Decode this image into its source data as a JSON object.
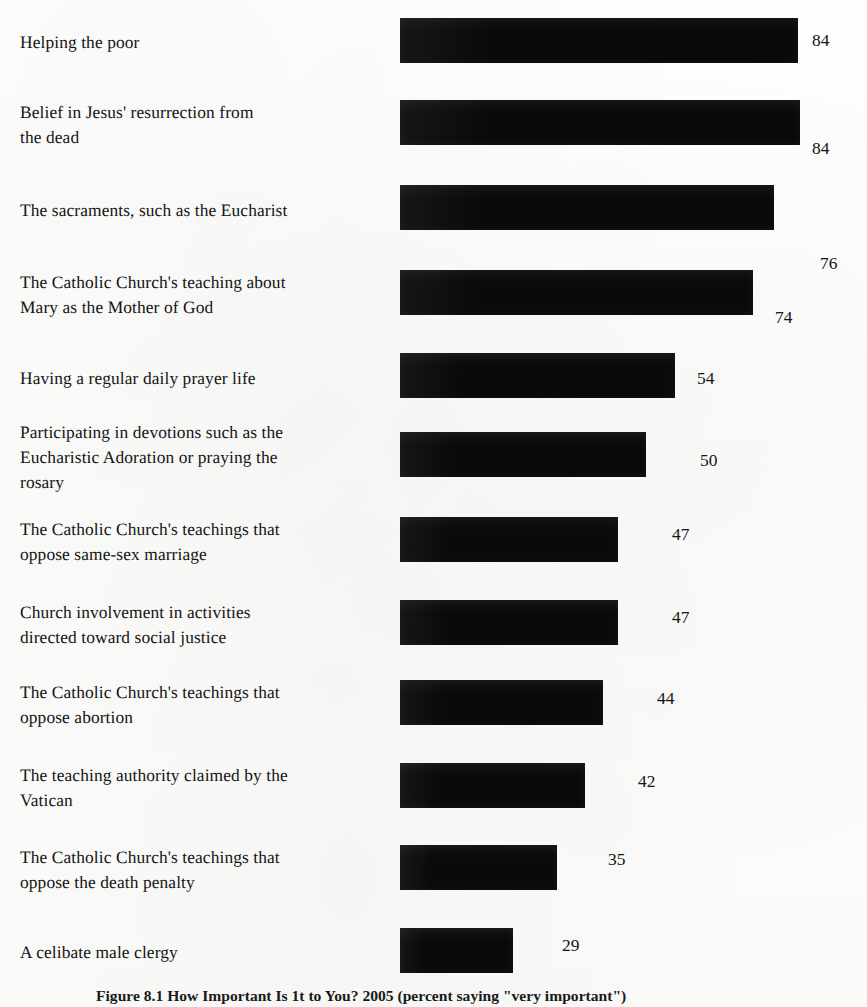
{
  "figure": {
    "caption": "Figure 8.1   How Important Is 1t to You? 2005 (percent saying \"very important\")"
  },
  "chart_data": {
    "type": "bar",
    "orientation": "horizontal",
    "title": "",
    "xlabel": "",
    "ylabel": "",
    "grid": false,
    "legend": null,
    "value_suffix": "",
    "xlim": [
      0,
      100
    ],
    "categories": [
      "Helping the poor",
      "Belief in Jesus' resurrection from\nthe dead",
      "The sacraments, such as the Eucharist",
      "The Catholic Church's teaching about\nMary as the Mother of God",
      "Having a regular daily prayer life",
      "Participating in devotions such as the\nEucharistic Adoration or praying the\nrosary",
      "The Catholic Church's teachings that\noppose same-sex marriage",
      "Church involvement in activities\ndirected toward social justice",
      "The Catholic Church's teachings that\noppose abortion",
      "The teaching authority claimed by the\nVatican",
      "The Catholic Church's teachings that\noppose the death penalty",
      "A celibate male clergy"
    ],
    "values": [
      84,
      84,
      76,
      74,
      54,
      50,
      47,
      47,
      44,
      42,
      35,
      29
    ],
    "bar_color": "#0a0a0a",
    "bars": [
      {
        "label": "Helping the poor",
        "value": 84,
        "bar_top": 18,
        "bar_width": 398,
        "label_top": 30,
        "value_left": 812,
        "value_top": 30
      },
      {
        "label": "Belief in Jesus' resurrection from\nthe dead",
        "value": 84,
        "bar_top": 100,
        "bar_width": 400,
        "label_top": 100,
        "value_left": 812,
        "value_top": 138
      },
      {
        "label": "The sacraments, such as the Eucharist",
        "value": 76,
        "bar_top": 185,
        "bar_width": 374,
        "label_top": 198,
        "value_left": 820,
        "value_top": 253
      },
      {
        "label": "The Catholic Church's teaching about\nMary as the Mother of God",
        "value": 74,
        "bar_top": 270,
        "bar_width": 353,
        "label_top": 270,
        "value_left": 775,
        "value_top": 307
      },
      {
        "label": "Having a regular daily prayer life",
        "value": 54,
        "bar_top": 353,
        "bar_width": 275,
        "label_top": 366,
        "value_left": 697,
        "value_top": 368
      },
      {
        "label": "Participating in devotions such as the\nEucharistic Adoration or praying the\nrosary",
        "value": 50,
        "bar_top": 432,
        "bar_width": 246,
        "label_top": 420,
        "value_left": 700,
        "value_top": 450
      },
      {
        "label": "The Catholic Church's teachings that\noppose same-sex marriage",
        "value": 47,
        "bar_top": 517,
        "bar_width": 218,
        "label_top": 517,
        "value_left": 672,
        "value_top": 524
      },
      {
        "label": "Church involvement in activities\ndirected toward social justice",
        "value": 47,
        "bar_top": 600,
        "bar_width": 218,
        "label_top": 600,
        "value_left": 672,
        "value_top": 607
      },
      {
        "label": "The Catholic Church's teachings that\noppose abortion",
        "value": 44,
        "bar_top": 680,
        "bar_width": 203,
        "label_top": 680,
        "value_left": 657,
        "value_top": 688
      },
      {
        "label": "The teaching authority claimed by the\nVatican",
        "value": 42,
        "bar_top": 763,
        "bar_width": 185,
        "label_top": 763,
        "value_left": 638,
        "value_top": 771
      },
      {
        "label": "The Catholic Church's teachings that\noppose the death penalty",
        "value": 35,
        "bar_top": 845,
        "bar_width": 157,
        "label_top": 845,
        "value_left": 608,
        "value_top": 849
      },
      {
        "label": "A celibate male clergy",
        "value": 29,
        "bar_top": 928,
        "bar_width": 113,
        "label_top": 940,
        "value_left": 562,
        "value_top": 935
      }
    ],
    "bar_left": 400,
    "bar_height": 45
  }
}
